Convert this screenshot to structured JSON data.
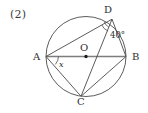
{
  "problem": {
    "number_label": "(2)"
  },
  "figure": {
    "type": "circle-geometry",
    "stroke_color": "#4a4a4a",
    "text_color": "#2e2e2e",
    "circle": {
      "center_x": 86,
      "center_y": 56.5,
      "radius": 40
    },
    "center_point": {
      "label": "O",
      "x": 86,
      "y": 56.5,
      "marked": true
    },
    "points": [
      {
        "name": "A",
        "label": "A",
        "x": 46,
        "y": 56.5
      },
      {
        "name": "B",
        "label": "B",
        "x": 126,
        "y": 56.5
      },
      {
        "name": "C",
        "label": "C",
        "x": 81,
        "y": 96.3
      },
      {
        "name": "D",
        "label": "D",
        "x": 112,
        "y": 19.2
      }
    ],
    "segments": [
      {
        "name": "diameter-AB",
        "from": "A",
        "to": "B"
      },
      {
        "name": "chord-AD",
        "from": "A",
        "to": "D"
      },
      {
        "name": "chord-AC",
        "from": "A",
        "to": "C"
      },
      {
        "name": "chord-DC",
        "from": "D",
        "to": "C"
      },
      {
        "name": "chord-CB",
        "from": "C",
        "to": "B"
      },
      {
        "name": "chord-DB",
        "from": "D",
        "to": "B"
      }
    ],
    "angles": [
      {
        "name": "angle-x-at-A",
        "vertex": "A",
        "label": "x",
        "italic": true,
        "arc": true
      },
      {
        "name": "angle-40-at-D",
        "vertex": "D",
        "label": "40°",
        "italic": false,
        "arc": true,
        "value": 40,
        "unit": "degrees"
      }
    ]
  }
}
